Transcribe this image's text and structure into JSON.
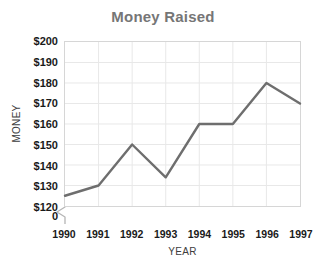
{
  "chart_data": {
    "type": "line",
    "title": "Money Raised",
    "xlabel": "YEAR",
    "ylabel": "MONEY",
    "categories": [
      "1990",
      "1991",
      "1992",
      "1993",
      "1994",
      "1995",
      "1996",
      "1997"
    ],
    "values": [
      125,
      130,
      150,
      134,
      160,
      160,
      180,
      170
    ],
    "series": [
      {
        "name": "Money Raised",
        "values": [
          125,
          130,
          150,
          134,
          160,
          160,
          180,
          170
        ]
      }
    ],
    "ylim": [
      120,
      200
    ],
    "ytick_labels": [
      "$200",
      "$190",
      "$180",
      "$170",
      "$160",
      "$150",
      "$140",
      "$130",
      "$120"
    ],
    "ytick_values": [
      200,
      190,
      180,
      170,
      160,
      150,
      140,
      130,
      120
    ],
    "zero_label": "0",
    "axis_break": true,
    "grid": true,
    "legend": "none",
    "line_color": "#6e6e6e",
    "grid_color": "#e8e8e8",
    "border_color": "#d6d6d6",
    "title_color": "#767676",
    "label_color": "#1a1a1a",
    "axis_title_color": "#3d3d3d"
  }
}
